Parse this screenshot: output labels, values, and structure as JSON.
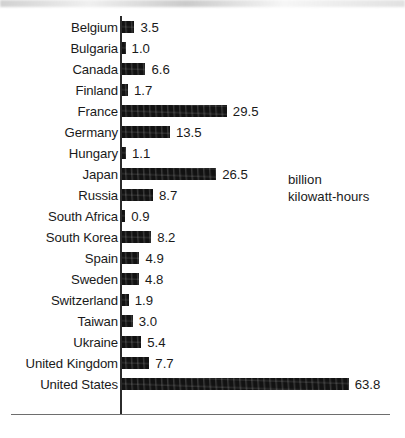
{
  "chart_data": {
    "type": "bar",
    "orientation": "horizontal",
    "title": "",
    "subtitle": "",
    "xlabel": "",
    "ylabel": "",
    "unit_annotation": [
      "billion",
      "kilowatt-hours"
    ],
    "grid": false,
    "legend": false,
    "xlim": [
      0,
      63.8
    ],
    "value_format": "one-decimal",
    "categories": [
      "Belgium",
      "Bulgaria",
      "Canada",
      "Finland",
      "France",
      "Germany",
      "Hungary",
      "Japan",
      "Russia",
      "South Africa",
      "South Korea",
      "Spain",
      "Sweden",
      "Switzerland",
      "Taiwan",
      "Ukraine",
      "United Kingdom",
      "United States"
    ],
    "values": [
      3.5,
      1.0,
      6.6,
      1.7,
      29.5,
      13.5,
      1.1,
      26.5,
      8.7,
      0.9,
      8.2,
      4.9,
      4.8,
      1.9,
      3.0,
      5.4,
      7.7,
      63.8
    ],
    "value_labels": [
      "3.5",
      "1.0",
      "6.6",
      "1.7",
      "29.5",
      "13.5",
      "1.1",
      "26.5",
      "8.7",
      "0.9",
      "8.2",
      "4.9",
      "4.8",
      "1.9",
      "3.0",
      "5.4",
      "7.7",
      "63.8"
    ],
    "bar_color": "#121212",
    "axis_color": "#2b2b2b",
    "background_color": "#ffffff"
  },
  "layout": {
    "axis_x": 120,
    "axis_top": 16,
    "axis_bottom": 414,
    "row_start": 16,
    "row_height": 21.0,
    "px_per_unit": 3.553,
    "bar_left": 122,
    "value_gap": 6
  }
}
